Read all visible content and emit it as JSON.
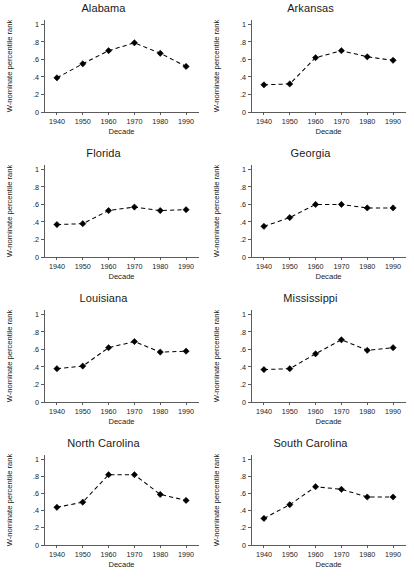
{
  "figure": {
    "rows": 4,
    "cols": 2,
    "width": 414,
    "height": 578,
    "background": "#ffffff",
    "line_color": "#000000",
    "axis_color": "#4a4a4a"
  },
  "chart_data": [
    {
      "type": "line",
      "title": "Alabama",
      "xlabel": "Decade",
      "ylabel": "W-nominate percentile rank",
      "x": [
        1940,
        1950,
        1960,
        1970,
        1980,
        1990
      ],
      "values": [
        0.39,
        0.55,
        0.7,
        0.79,
        0.67,
        0.52
      ],
      "xlim": [
        1935,
        1995
      ],
      "ylim": [
        0,
        1.05
      ],
      "xticks": [
        1940,
        1950,
        1960,
        1970,
        1980,
        1990
      ],
      "xticklabels": [
        "1940",
        "1950",
        "1960",
        "1970",
        "1980",
        "1990"
      ],
      "yticks": [
        0,
        0.2,
        0.4,
        0.6,
        0.8,
        1
      ],
      "yticklabels": [
        "0",
        ".2",
        ".4",
        ".6",
        ".8",
        "1"
      ],
      "grid": false,
      "legend": "none",
      "marker": "diamond",
      "linestyle": "dashed"
    },
    {
      "type": "line",
      "title": "Arkansas",
      "xlabel": "Decade",
      "ylabel": "W-nominate percentile rank",
      "x": [
        1940,
        1950,
        1960,
        1970,
        1980,
        1990
      ],
      "values": [
        0.31,
        0.32,
        0.62,
        0.7,
        0.63,
        0.59
      ],
      "xlim": [
        1935,
        1995
      ],
      "ylim": [
        0,
        1.05
      ],
      "xticks": [
        1940,
        1950,
        1960,
        1970,
        1980,
        1990
      ],
      "xticklabels": [
        "1940",
        "1950",
        "1960",
        "1970",
        "1980",
        "1990"
      ],
      "yticks": [
        0,
        0.2,
        0.4,
        0.6,
        0.8,
        1
      ],
      "yticklabels": [
        "0",
        ".2",
        ".4",
        ".6",
        ".8",
        "1"
      ],
      "grid": false,
      "legend": "none",
      "marker": "diamond",
      "linestyle": "dashed"
    },
    {
      "type": "line",
      "title": "Florida",
      "xlabel": "Decade",
      "ylabel": "W-nominate percentile rank",
      "x": [
        1940,
        1950,
        1960,
        1970,
        1980,
        1990
      ],
      "values": [
        0.37,
        0.38,
        0.53,
        0.57,
        0.53,
        0.54
      ],
      "xlim": [
        1935,
        1995
      ],
      "ylim": [
        0,
        1.05
      ],
      "xticks": [
        1940,
        1950,
        1960,
        1970,
        1980,
        1990
      ],
      "xticklabels": [
        "1940",
        "1950",
        "1960",
        "1970",
        "1980",
        "1990"
      ],
      "yticks": [
        0,
        0.2,
        0.4,
        0.6,
        0.8,
        1
      ],
      "yticklabels": [
        "0",
        ".2",
        ".4",
        ".6",
        ".8",
        "1"
      ],
      "grid": false,
      "legend": "none",
      "marker": "diamond",
      "linestyle": "dashed"
    },
    {
      "type": "line",
      "title": "Georgia",
      "xlabel": "Decade",
      "ylabel": "W-nominate percentile rank",
      "x": [
        1940,
        1950,
        1960,
        1970,
        1980,
        1990
      ],
      "values": [
        0.35,
        0.45,
        0.6,
        0.6,
        0.56,
        0.56
      ],
      "xlim": [
        1935,
        1995
      ],
      "ylim": [
        0,
        1.05
      ],
      "xticks": [
        1940,
        1950,
        1960,
        1970,
        1980,
        1990
      ],
      "xticklabels": [
        "1940",
        "1950",
        "1960",
        "1970",
        "1980",
        "1990"
      ],
      "yticks": [
        0,
        0.2,
        0.4,
        0.6,
        0.8,
        1
      ],
      "yticklabels": [
        "0",
        ".2",
        ".4",
        ".6",
        ".8",
        "1"
      ],
      "grid": false,
      "legend": "none",
      "marker": "diamond",
      "linestyle": "dashed"
    },
    {
      "type": "line",
      "title": "Louisiana",
      "xlabel": "Decade",
      "ylabel": "W-nominate percentile rank",
      "x": [
        1940,
        1950,
        1960,
        1970,
        1980,
        1990
      ],
      "values": [
        0.38,
        0.41,
        0.62,
        0.69,
        0.57,
        0.58
      ],
      "xlim": [
        1935,
        1995
      ],
      "ylim": [
        0,
        1.05
      ],
      "xticks": [
        1940,
        1950,
        1960,
        1970,
        1980,
        1990
      ],
      "xticklabels": [
        "1940",
        "1950",
        "1960",
        "1970",
        "1980",
        "1990"
      ],
      "yticks": [
        0,
        0.2,
        0.4,
        0.6,
        0.8,
        1
      ],
      "yticklabels": [
        "0",
        ".2",
        ".4",
        ".6",
        ".8",
        "1"
      ],
      "grid": false,
      "legend": "none",
      "marker": "diamond",
      "linestyle": "dashed"
    },
    {
      "type": "line",
      "title": "Mississippi",
      "xlabel": "Decade",
      "ylabel": "W-nominate percentile rank",
      "x": [
        1940,
        1950,
        1960,
        1970,
        1980,
        1990
      ],
      "values": [
        0.37,
        0.38,
        0.55,
        0.71,
        0.59,
        0.62
      ],
      "xlim": [
        1935,
        1995
      ],
      "ylim": [
        0,
        1.05
      ],
      "xticks": [
        1940,
        1950,
        1960,
        1970,
        1980,
        1990
      ],
      "xticklabels": [
        "1940",
        "1950",
        "1960",
        "1970",
        "1980",
        "1990"
      ],
      "yticks": [
        0,
        0.2,
        0.4,
        0.6,
        0.8,
        1
      ],
      "yticklabels": [
        "0",
        ".2",
        ".4",
        ".6",
        ".8",
        "1"
      ],
      "grid": false,
      "legend": "none",
      "marker": "diamond",
      "linestyle": "dashed"
    },
    {
      "type": "line",
      "title": "North Carolina",
      "xlabel": "Decade",
      "ylabel": "W-nominate percentile rank",
      "x": [
        1940,
        1950,
        1960,
        1970,
        1980,
        1990
      ],
      "values": [
        0.44,
        0.5,
        0.82,
        0.82,
        0.59,
        0.52
      ],
      "xlim": [
        1935,
        1995
      ],
      "ylim": [
        0,
        1.05
      ],
      "xticks": [
        1940,
        1950,
        1960,
        1970,
        1980,
        1990
      ],
      "xticklabels": [
        "1940",
        "1950",
        "1960",
        "1970",
        "1980",
        "1990"
      ],
      "yticks": [
        0,
        0.2,
        0.4,
        0.6,
        0.8,
        1
      ],
      "yticklabels": [
        "0",
        ".2",
        ".4",
        ".6",
        ".8",
        "1"
      ],
      "grid": false,
      "legend": "none",
      "marker": "diamond",
      "linestyle": "dashed"
    },
    {
      "type": "line",
      "title": "South Carolina",
      "xlabel": "Decade",
      "ylabel": "W-nominate percentile rank",
      "x": [
        1940,
        1950,
        1960,
        1970,
        1980,
        1990
      ],
      "values": [
        0.31,
        0.47,
        0.68,
        0.65,
        0.56,
        0.56
      ],
      "xlim": [
        1935,
        1995
      ],
      "ylim": [
        0,
        1.05
      ],
      "xticks": [
        1940,
        1950,
        1960,
        1970,
        1980,
        1990
      ],
      "xticklabels": [
        "1940",
        "1950",
        "1960",
        "1970",
        "1980",
        "1990"
      ],
      "yticks": [
        0,
        0.2,
        0.4,
        0.6,
        0.8,
        1
      ],
      "yticklabels": [
        "0",
        ".2",
        ".4",
        ".6",
        ".8",
        "1"
      ],
      "grid": false,
      "legend": "none",
      "marker": "diamond",
      "linestyle": "dashed"
    }
  ]
}
